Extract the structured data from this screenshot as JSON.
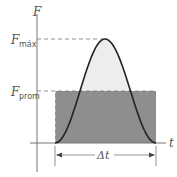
{
  "diagram": {
    "labels": {
      "y_axis": "F",
      "x_axis": "t",
      "f_max_main": "F",
      "f_max_sub": "máx",
      "f_prom_main": "F",
      "f_prom_sub": "prom",
      "delta_t": "Δt"
    },
    "colors": {
      "axis": "#777777",
      "curve": "#222222",
      "pulse_fill": "#ededed",
      "average_fill": "#8e8e8e",
      "dashed": "#777777"
    },
    "curve": {
      "shape": "bell-shaped force pulse",
      "start_t": 0,
      "end_t": 1,
      "peak_t": 0.5,
      "peak_value": "F_max",
      "average_value": "F_prom"
    }
  }
}
